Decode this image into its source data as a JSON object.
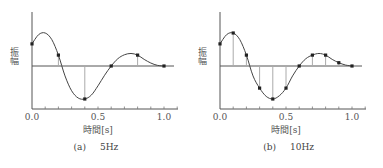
{
  "chart_data": [
    {
      "type": "line",
      "panel": "a",
      "caption_label": "(a)",
      "caption_text": "5Hz",
      "title": "",
      "xlabel": "時間[s]",
      "ylabel": "振幅",
      "xlim": [
        0.0,
        1.1
      ],
      "ylim": [
        -1.2,
        1.4
      ],
      "xticks": [
        0.0,
        0.5,
        1.0
      ],
      "xtick_labels": [
        "0.0",
        "0.5",
        "1.0"
      ],
      "minor_tick_step": 0.1,
      "grid": false,
      "curve": {
        "x": [
          0.0,
          0.05,
          0.1,
          0.15,
          0.2,
          0.25,
          0.3,
          0.35,
          0.4,
          0.45,
          0.5,
          0.55,
          0.6,
          0.65,
          0.7,
          0.75,
          0.8,
          0.85,
          0.9,
          0.95,
          1.0
        ],
        "y": [
          0.67,
          0.95,
          1.0,
          0.8,
          0.33,
          -0.3,
          -0.75,
          -0.97,
          -1.0,
          -0.88,
          -0.6,
          -0.28,
          0.0,
          0.22,
          0.34,
          0.38,
          0.33,
          0.2,
          0.09,
          0.02,
          0.0
        ]
      },
      "samples": {
        "x": [
          0.0,
          0.2,
          0.4,
          0.6,
          0.8,
          1.0
        ],
        "y": [
          0.67,
          0.33,
          -1.0,
          0.0,
          0.33,
          0.0
        ]
      }
    },
    {
      "type": "line",
      "panel": "b",
      "caption_label": "(b)",
      "caption_text": "10Hz",
      "title": "",
      "xlabel": "時間[s]",
      "ylabel": "振幅",
      "xlim": [
        0.0,
        1.1
      ],
      "ylim": [
        -1.2,
        1.4
      ],
      "xticks": [
        0.0,
        0.5,
        1.0
      ],
      "xtick_labels": [
        "0.0",
        "0.5",
        "1.0"
      ],
      "minor_tick_step": 0.1,
      "grid": false,
      "curve": {
        "x": [
          0.0,
          0.05,
          0.1,
          0.15,
          0.2,
          0.25,
          0.3,
          0.35,
          0.4,
          0.45,
          0.5,
          0.55,
          0.6,
          0.65,
          0.7,
          0.75,
          0.8,
          0.85,
          0.9,
          0.95,
          1.0
        ],
        "y": [
          0.67,
          0.95,
          1.0,
          0.8,
          0.33,
          -0.3,
          -0.67,
          -0.92,
          -1.0,
          -0.9,
          -0.67,
          -0.3,
          0.0,
          0.22,
          0.33,
          0.38,
          0.33,
          0.2,
          0.1,
          0.03,
          0.0
        ]
      },
      "samples": {
        "x": [
          0.0,
          0.1,
          0.2,
          0.3,
          0.4,
          0.5,
          0.6,
          0.7,
          0.8,
          0.9,
          1.0
        ],
        "y": [
          0.67,
          1.0,
          0.33,
          -0.67,
          -1.0,
          -0.67,
          0.0,
          0.33,
          0.33,
          0.1,
          0.0
        ]
      }
    }
  ]
}
